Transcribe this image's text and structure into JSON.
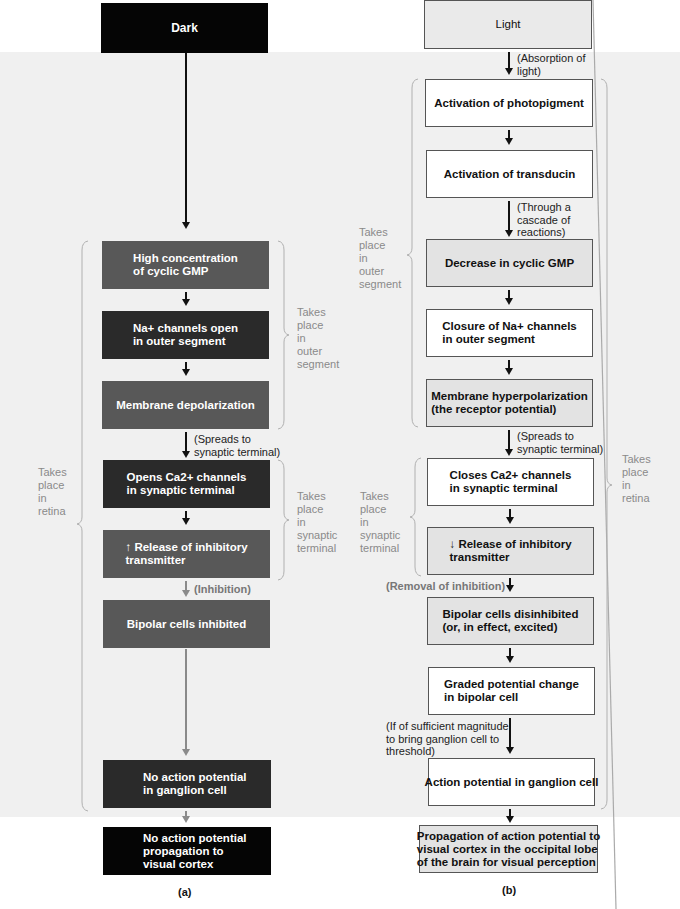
{
  "panel_a": {
    "caption": "(a)",
    "start": "Dark",
    "steps": [
      {
        "text": "High concentration\nof cyclic GMP",
        "shade": "mid"
      },
      {
        "text": "Na+ channels open\nin outer segment",
        "shade": "dark"
      },
      {
        "text": "Membrane depolarization",
        "shade": "mid"
      },
      {
        "text": "Opens Ca2+ channels\nin synaptic terminal",
        "shade": "dark"
      },
      {
        "text": "↑ Release of inhibitory\ntransmitter",
        "shade": "mid"
      },
      {
        "text": "Bipolar cells inhibited",
        "shade": "mid"
      },
      {
        "text": "No action potential\nin ganglion cell",
        "shade": "dark"
      },
      {
        "text": "No action potential\npropagation to\nvisual cortex",
        "shade": "black"
      }
    ],
    "notes": {
      "spreads": "(Spreads to\nsynaptic terminal)",
      "inhibition": "(Inhibition)"
    },
    "braces": {
      "outer_segment": "Takes\nplace\nin\nouter\nsegment",
      "synaptic_terminal": "Takes\nplace\nin\nsynaptic\nterminal",
      "retina": "Takes\nplace\nin\nretina"
    }
  },
  "panel_b": {
    "caption": "(b)",
    "start": "Light",
    "steps": [
      {
        "text": "Activation of photopigment",
        "shade": "white"
      },
      {
        "text": "Activation of transducin",
        "shade": "white"
      },
      {
        "text": "Decrease in cyclic GMP",
        "shade": "lgray"
      },
      {
        "text": "Closure of Na+ channels\nin outer segment",
        "shade": "white"
      },
      {
        "text": "Membrane hyperpolarization\n(the receptor potential)",
        "shade": "lgray"
      },
      {
        "text": "Closes Ca2+ channels\nin synaptic terminal",
        "shade": "white"
      },
      {
        "text": "↓ Release of inhibitory\ntransmitter",
        "shade": "lgray"
      },
      {
        "text": "Bipolar cells disinhibited\n(or, in effect, excited)",
        "shade": "lgray"
      },
      {
        "text": "Graded potential change\nin bipolar cell",
        "shade": "white"
      },
      {
        "text": "Action potential in ganglion cell",
        "shade": "white"
      },
      {
        "text": "Propagation of action potential to\nvisual cortex in the occipital lobe\nof the brain for visual perception",
        "shade": "lgray"
      }
    ],
    "notes": {
      "absorption": "(Absorption of\nlight)",
      "cascade": "(Through a\ncascade of\nreactions)",
      "spreads": "(Spreads to\nsynaptic terminal)",
      "removal": "(Removal of inhibition)",
      "magnitude": "(If of sufficient magnitude\nto bring ganglion cell to\nthreshold)"
    },
    "braces": {
      "outer_segment": "Takes\nplace\nin\nouter\nsegment",
      "synaptic_terminal": "Takes\nplace\nin\nsynaptic\nterminal",
      "retina": "Takes\nplace\nin\nretina"
    }
  }
}
